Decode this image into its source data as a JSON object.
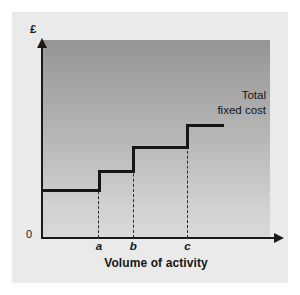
{
  "figure": {
    "card_color": "#eaeaea",
    "plot_top_color": "#959595",
    "plot_bottom_color": "#d9d9d9",
    "line_color": "#161616"
  },
  "axes": {
    "y_axis_title": "£",
    "origin_label": "0",
    "x_axis_title": "Volume of activity",
    "tick_labels": [
      "a",
      "b",
      "c"
    ]
  },
  "annotations": {
    "series_label_line1": "Total",
    "series_label_line2": "fixed cost"
  },
  "chart_data": {
    "type": "line",
    "title": "",
    "subtitle": "",
    "xlabel": "Volume of activity",
    "ylabel": "£",
    "grid": false,
    "legend_position": "none",
    "style": "step-post",
    "xlim": [
      0,
      4
    ],
    "ylim": [
      0,
      5
    ],
    "x_tick_labels": [
      "a",
      "b",
      "c"
    ],
    "x_tick_values": [
      1,
      1.6,
      2.55
    ],
    "y_tick_labels": [
      "0"
    ],
    "y_tick_values": [
      0
    ],
    "series": [
      {
        "name": "Total fixed cost",
        "x": [
          0,
          1,
          1,
          1.6,
          1.6,
          2.55,
          2.55,
          3.2
        ],
        "values": [
          1.2,
          1.2,
          1.67,
          1.67,
          2.28,
          2.28,
          2.84,
          2.84
        ],
        "steps": [
          {
            "from_x": 0,
            "to_x": 1,
            "level": 1.2
          },
          {
            "from_x": 1,
            "to_x": 1.6,
            "level": 1.67
          },
          {
            "from_x": 1.6,
            "to_x": 2.55,
            "level": 2.28
          },
          {
            "from_x": 2.55,
            "to_x": 3.2,
            "level": 2.84
          }
        ]
      }
    ],
    "annotations": [
      {
        "text": "Total fixed cost",
        "x": 2.75,
        "y": 3.5,
        "align": "right"
      }
    ]
  }
}
